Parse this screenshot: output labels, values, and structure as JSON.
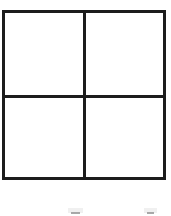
{
  "page": {
    "background_color": "#ffffff",
    "width": 171,
    "height": 216
  },
  "figure": {
    "name": "four-quadrant-square",
    "stroke_color": "#1c1c1c",
    "fill_color": "#ffffff",
    "stroke_width_px": 3,
    "rows": 2,
    "columns": 2,
    "quadrants": [
      {
        "position": "top-left",
        "label": ""
      },
      {
        "position": "top-right",
        "label": ""
      },
      {
        "position": "bottom-left",
        "label": ""
      },
      {
        "position": "bottom-right",
        "label": ""
      }
    ]
  },
  "caption": {
    "visible_text": "",
    "note": "two faint partial glyph tops clipped by the bottom edge of the image",
    "fragment_color": "#9a9a9a",
    "fragments": [
      "",
      ""
    ]
  }
}
